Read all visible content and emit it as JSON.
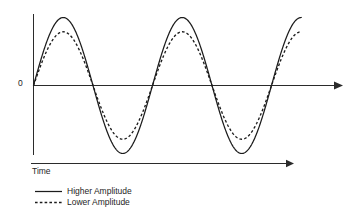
{
  "figure": {
    "background_color": "#ffffff",
    "line_color": "#1c1c1c",
    "axis_color": "#2b2b2b",
    "width": 349,
    "height": 218
  },
  "axes": {
    "origin_label": "0",
    "x_axis_caption": "Time",
    "y_axis_name": "amplitude-axis",
    "x_axis_name": "time-axis"
  },
  "legend": {
    "entries": [
      {
        "label": "Higher Amplitude",
        "style": "solid"
      },
      {
        "label": "Lower Amplitude",
        "style": "dashed"
      }
    ]
  },
  "chart_data": {
    "type": "line",
    "title": "",
    "subtitle": "",
    "xlabel": "Time",
    "ylabel": "",
    "grid": false,
    "legend_position": "bottom-left",
    "xlim": [
      0,
      2.25
    ],
    "ylim": [
      -1.05,
      1.05
    ],
    "x_tick_labels": [],
    "y_tick_labels": [
      "0"
    ],
    "x_unit": "cycles",
    "annotations": [
      {
        "text": "0",
        "x": 0,
        "y": 0,
        "position": "axis-origin-left"
      },
      {
        "text": "Time",
        "x": 0,
        "y": -1.05,
        "position": "below-time-arrow"
      }
    ],
    "series": [
      {
        "name": "Higher Amplitude",
        "style": "solid",
        "amplitude": 1.0,
        "cycles": 2.25,
        "phase": 0,
        "waveform": "sine",
        "color": "#1c1c1c",
        "peaks": [
          {
            "x": 0.25,
            "y": 1.0
          },
          {
            "x": 1.25,
            "y": 1.0
          }
        ],
        "troughs": [
          {
            "x": 0.75,
            "y": -1.0
          },
          {
            "x": 1.75,
            "y": -1.0
          }
        ],
        "zero_crossings": [
          0,
          0.5,
          1.0,
          1.5,
          2.0,
          2.25
        ]
      },
      {
        "name": "Lower Amplitude",
        "style": "dashed",
        "amplitude": 0.79,
        "cycles": 2.25,
        "phase": 0,
        "waveform": "sine",
        "color": "#1c1c1c",
        "peaks": [
          {
            "x": 0.25,
            "y": 0.79
          },
          {
            "x": 1.25,
            "y": 0.79
          }
        ],
        "troughs": [
          {
            "x": 0.75,
            "y": -0.79
          },
          {
            "x": 1.75,
            "y": -0.79
          }
        ],
        "zero_crossings": [
          0,
          0.5,
          1.0,
          1.5,
          2.0,
          2.25
        ]
      }
    ]
  }
}
